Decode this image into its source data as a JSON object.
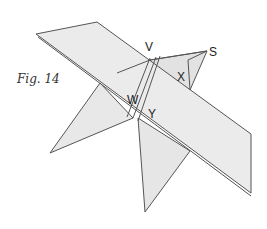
{
  "figure": {
    "caption": "Fig. 14",
    "labels": {
      "V": "V",
      "S": "S",
      "X": "X",
      "W": "W",
      "Y": "Y"
    },
    "colors": {
      "plane_fill": "#e8e8e8",
      "plane_fill_dark": "#dedede",
      "edge": "#555555",
      "background": "#ffffff"
    }
  }
}
